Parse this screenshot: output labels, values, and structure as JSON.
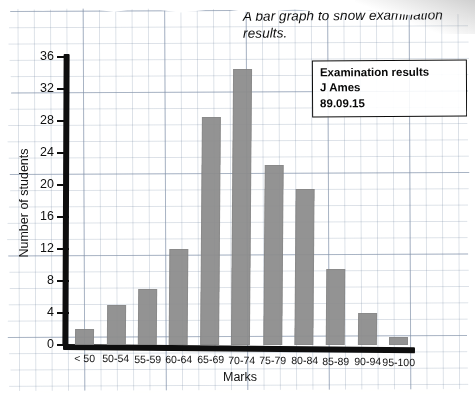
{
  "chart_data": {
    "type": "bar",
    "title": "A bar graph to show examination results.",
    "xlabel": "Marks",
    "ylabel": "Number of students",
    "categories": [
      "< 50",
      "50-54",
      "55-59",
      "60-64",
      "65-69",
      "70-74",
      "75-79",
      "80-84",
      "85-89",
      "90-94",
      "95-100"
    ],
    "values": [
      2,
      5,
      7,
      12,
      28.5,
      34.5,
      22.5,
      19.5,
      9.5,
      4,
      1
    ],
    "ylim": [
      0,
      37
    ],
    "yticks": [
      0,
      4,
      8,
      12,
      16,
      20,
      24,
      28,
      32,
      36
    ],
    "ytick_labels": [
      "0",
      "4",
      "8",
      "12",
      "16",
      "20",
      "24",
      "28",
      "32",
      "36"
    ],
    "grid": true,
    "grid_style": "graph-paper",
    "legend_position": "top-right",
    "bar_color": "#8d8d8d",
    "axis_color": "#101010"
  },
  "legend": {
    "line1": "Examination results",
    "line2": "J Ames",
    "line3": "89.09.15"
  },
  "colors": {
    "bar": "#8d8d8d",
    "axis": "#101010",
    "grid": "#6e8cb9",
    "paper": "#fefefe",
    "text": "#141414"
  }
}
